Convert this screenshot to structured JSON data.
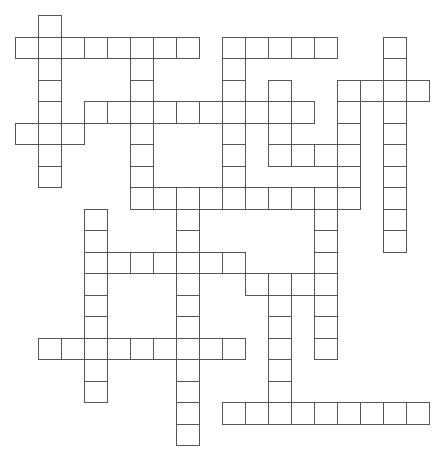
{
  "puzzle": {
    "type": "crossword-grid",
    "origin": {
      "x": 15,
      "y": 15
    },
    "cell_size": {
      "w": 23,
      "h": 21.5
    },
    "colors": {
      "line": "#555555",
      "cell_fill": "#ffffff",
      "background": "#ffffff"
    },
    "entries": [
      {
        "dir": "down",
        "col": 1,
        "row": 0,
        "length": 8
      },
      {
        "dir": "across",
        "col": 0,
        "row": 1,
        "length": 8
      },
      {
        "dir": "down",
        "col": 5,
        "row": 1,
        "length": 8
      },
      {
        "dir": "across",
        "col": 9,
        "row": 1,
        "length": 5
      },
      {
        "dir": "down",
        "col": 9,
        "row": 1,
        "length": 8
      },
      {
        "dir": "down",
        "col": 16,
        "row": 1,
        "length": 10
      },
      {
        "dir": "across",
        "col": 14,
        "row": 3,
        "length": 4
      },
      {
        "dir": "down",
        "col": 11,
        "row": 3,
        "length": 4
      },
      {
        "dir": "down",
        "col": 14,
        "row": 3,
        "length": 6
      },
      {
        "dir": "across",
        "col": 3,
        "row": 4,
        "length": 10
      },
      {
        "dir": "across",
        "col": 0,
        "row": 5,
        "length": 3
      },
      {
        "dir": "across",
        "col": 11,
        "row": 6,
        "length": 4
      },
      {
        "dir": "across",
        "col": 5,
        "row": 8,
        "length": 10
      },
      {
        "dir": "down",
        "col": 7,
        "row": 8,
        "length": 12
      },
      {
        "dir": "down",
        "col": 3,
        "row": 9,
        "length": 9
      },
      {
        "dir": "down",
        "col": 13,
        "row": 9,
        "length": 7
      },
      {
        "dir": "across",
        "col": 3,
        "row": 11,
        "length": 7
      },
      {
        "dir": "across",
        "col": 10,
        "row": 12,
        "length": 4
      },
      {
        "dir": "down",
        "col": 11,
        "row": 12,
        "length": 7
      },
      {
        "dir": "across",
        "col": 1,
        "row": 15,
        "length": 9
      },
      {
        "dir": "across",
        "col": 9,
        "row": 18,
        "length": 9
      }
    ]
  }
}
